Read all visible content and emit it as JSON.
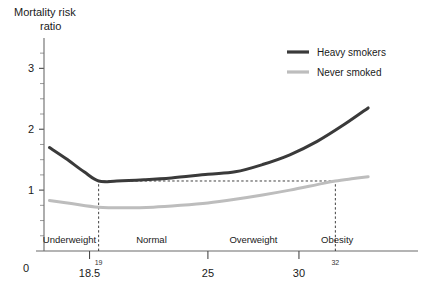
{
  "chart_data": {
    "type": "line",
    "title": "Mortality risk ratio",
    "title_line1": "Mortality risk",
    "title_line2": "ratio",
    "xlabel": "",
    "ylabel": "Mortality risk ratio",
    "grid": false,
    "legend_position": "top-right",
    "xlim": [
      16.0,
      35.0
    ],
    "ylim": [
      0,
      3.4
    ],
    "y_ticks_labeled": [
      0,
      1,
      2,
      3
    ],
    "y_ticks_minor": [
      0.25,
      0.5,
      0.75,
      1.25,
      1.5,
      1.75,
      2.25,
      2.5,
      2.75,
      3.25
    ],
    "x_ticks_labeled": [
      "18.5",
      "25",
      "30"
    ],
    "x_tick_values": [
      18.5,
      25,
      30
    ],
    "x_origin_label": "0",
    "bands": [
      {
        "label": "Underweight",
        "from": 16.0,
        "to": 18.8
      },
      {
        "label": "Normal",
        "from": 18.8,
        "to": 25.0
      },
      {
        "label": "Overweight",
        "from": 25.0,
        "to": 30.0
      },
      {
        "label": "Obesity",
        "from": 30.0,
        "to": 34.2
      }
    ],
    "annotations": [
      {
        "label": "19",
        "x": 19.0,
        "kind": "vertical-dashed-marker"
      },
      {
        "label": "32",
        "x": 32.0,
        "kind": "vertical-dashed-marker"
      }
    ],
    "reference_lines": [
      {
        "kind": "vertical-dashed",
        "x": 19.0,
        "y_from": 0,
        "y_to": 1.15
      },
      {
        "kind": "vertical-dashed",
        "x": 32.0,
        "y_from": 0,
        "y_to": 1.15
      },
      {
        "kind": "horizontal-dashed",
        "y": 1.15,
        "x_from": 19.0,
        "x_to": 32.0
      }
    ],
    "series": [
      {
        "name": "Heavy smokers",
        "color": "#3a3a3a",
        "width": 3.0,
        "x": [
          16.3,
          17.2,
          18.2,
          19.0,
          20.0,
          21.5,
          23.0,
          25.0,
          26.5,
          28.0,
          29.5,
          31.0,
          32.5,
          33.8
        ],
        "values": [
          1.7,
          1.52,
          1.3,
          1.15,
          1.15,
          1.17,
          1.2,
          1.26,
          1.3,
          1.42,
          1.58,
          1.8,
          2.08,
          2.35
        ]
      },
      {
        "name": "Never smoked",
        "color": "#bdbdbd",
        "width": 3.0,
        "x": [
          16.3,
          17.5,
          19.0,
          20.5,
          22.0,
          23.5,
          25.0,
          26.5,
          28.0,
          29.5,
          31.0,
          32.0,
          33.0,
          33.8
        ],
        "values": [
          0.83,
          0.78,
          0.72,
          0.71,
          0.72,
          0.75,
          0.79,
          0.85,
          0.92,
          1.0,
          1.09,
          1.15,
          1.19,
          1.22
        ]
      }
    ]
  },
  "legend": {
    "items": [
      {
        "label": "Heavy smokers",
        "color": "#3a3a3a"
      },
      {
        "label": "Never smoked",
        "color": "#bdbdbd"
      }
    ]
  }
}
